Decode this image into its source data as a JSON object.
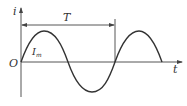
{
  "diagram": {
    "title": "",
    "type": "sinusoidal current waveform",
    "axes": {
      "y_label": "i",
      "x_label": "t",
      "origin_label": "O"
    },
    "period_label": "T",
    "amplitude_label": "I",
    "amplitude_subscript": "m",
    "colors": {
      "line": "#333333",
      "axis": "#555555",
      "background": "#ffffff"
    }
  }
}
